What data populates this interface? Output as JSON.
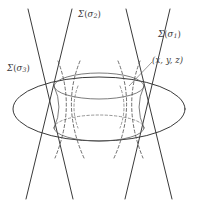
{
  "figure": {
    "title_sigma_symbol": "Σ",
    "labels": {
      "sigma2": {
        "name": "sigma-2-label",
        "sigma": "Σ",
        "open": "(",
        "var": "σ",
        "sub": "2",
        "close": ")"
      },
      "sigma1": {
        "name": "sigma-1-label",
        "sigma": "Σ",
        "open": "(",
        "var": "σ",
        "sub": "1",
        "close": ")"
      },
      "sigma3": {
        "name": "sigma-3-label",
        "sigma": "Σ",
        "open": "(",
        "var": "σ",
        "sub": "3",
        "close": ")"
      },
      "point": {
        "name": "point-coordinates-label",
        "text": "(x, y, z)"
      }
    },
    "colors": {
      "background": "#ffffff",
      "ink": "#3a3a3a",
      "ink_light": "#5a5a5a",
      "dash": "#4a4a4a",
      "leader": "#6d6d6d"
    },
    "geometry": {
      "description": "Hyperboloid of one sheet with two families of straight ruling lines, cut by a horizontal plane drawn as a large ellipse",
      "outer_ellipse": {
        "cx": 99,
        "cy": 109,
        "rx": 86,
        "ry": 32
      },
      "top_ellipse": {
        "cx": 99,
        "cy": 86,
        "rx": 45,
        "ry": 13
      },
      "bottom_ellipse": {
        "cx": 99,
        "cy": 128,
        "rx": 45,
        "ry": 13
      },
      "waist_half_width": 34,
      "waist_y": 107,
      "ruling_line_count": 4
    }
  }
}
